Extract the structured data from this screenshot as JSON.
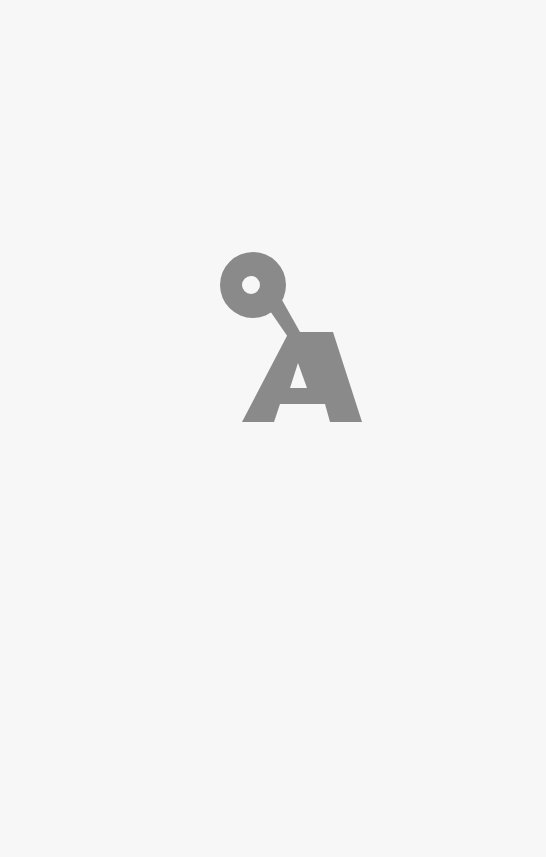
{
  "page": {
    "background": "#f7f7f7"
  },
  "logo": {
    "label": "QA",
    "letters": [
      "Q",
      "A"
    ],
    "color": "#8a8a8a",
    "icon": "qa-logo-icon"
  }
}
